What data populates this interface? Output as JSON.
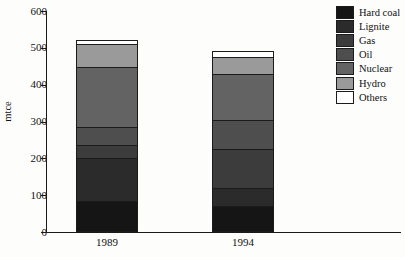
{
  "chart_data": {
    "type": "bar",
    "subtype": "stacked-bar",
    "title": "",
    "xlabel": "",
    "ylabel": "mtce",
    "categories": [
      "1989",
      "1994"
    ],
    "ylim": [
      0,
      600
    ],
    "yticks": [
      0,
      100,
      200,
      300,
      400,
      500,
      600
    ],
    "ytick_labels": [
      "0",
      "100",
      "200",
      "300",
      "400",
      "500",
      "600"
    ],
    "grid": false,
    "legend_position": "top-right",
    "series": [
      {
        "name": "Hard coal",
        "color": "#151515",
        "values": [
          80,
          65
        ]
      },
      {
        "name": "Lignite",
        "color": "#2b2b2b",
        "values": [
          115,
          50
        ]
      },
      {
        "name": "Gas",
        "color": "#3c3c3c",
        "values": [
          35,
          105
        ]
      },
      {
        "name": "Oil",
        "color": "#4e4e4e",
        "values": [
          50,
          80
        ]
      },
      {
        "name": "Nuclear",
        "color": "#636363",
        "values": [
          163,
          125
        ]
      },
      {
        "name": "Hydro",
        "color": "#9a9a9a",
        "values": [
          62,
          45
        ]
      },
      {
        "name": "Others",
        "color": "#ffffff",
        "values": [
          10,
          15
        ]
      }
    ],
    "totals": [
      515,
      485
    ]
  },
  "legend": {
    "items": [
      {
        "label": "Hard coal"
      },
      {
        "label": "Lignite"
      },
      {
        "label": "Gas"
      },
      {
        "label": "Oil"
      },
      {
        "label": "Nuclear"
      },
      {
        "label": "Hydro"
      },
      {
        "label": "Others"
      }
    ]
  },
  "axes": {
    "y_title": "mtce",
    "y_labels": [
      "600",
      "500",
      "400",
      "300",
      "200",
      "100",
      "0"
    ],
    "x_labels": [
      "1989",
      "1994"
    ]
  }
}
